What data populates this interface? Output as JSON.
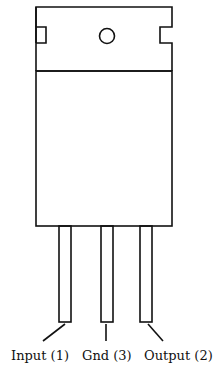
{
  "diagram": {
    "type": "component-package-outline",
    "stroke_color": "#111111",
    "background": "#ffffff",
    "package": {
      "tab": {
        "has_mounting_hole": true,
        "has_side_notches": true
      },
      "body": {}
    },
    "pins": [
      {
        "label": "Input (1)",
        "name": "Input",
        "number": "1"
      },
      {
        "label": "Gnd (3)",
        "name": "Gnd",
        "number": "3"
      },
      {
        "label": "Output (2)",
        "name": "Output",
        "number": "2"
      }
    ]
  }
}
